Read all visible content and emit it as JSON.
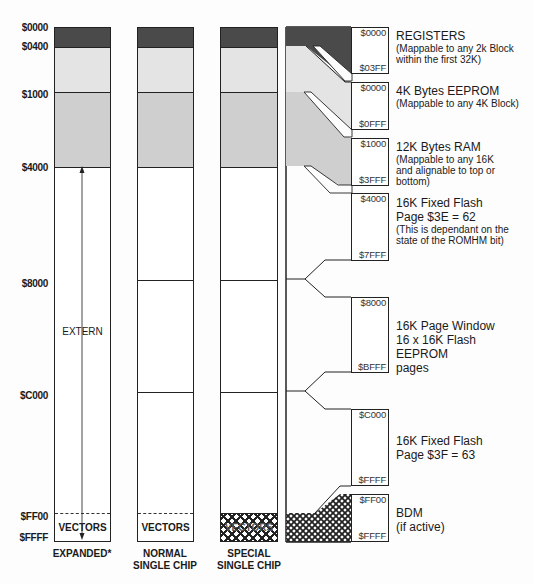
{
  "address_axis": {
    "labels": [
      "$0000",
      "$0400",
      "$1000",
      "$4000",
      "$8000",
      "$C000",
      "$FF00",
      "$FFFF"
    ]
  },
  "columns": [
    {
      "caption_line1": "EXPANDED*",
      "caption_line2": "",
      "bottom_label": "VECTORS",
      "middle_label": "EXTERN"
    },
    {
      "caption_line1": "NORMAL",
      "caption_line2": "SINGLE CHIP",
      "bottom_label": "VECTORS"
    },
    {
      "caption_line1": "SPECIAL",
      "caption_line2": "SINGLE CHIP",
      "bottom_label": "VECTORS"
    }
  ],
  "detail_blocks": [
    {
      "start": "$0000",
      "end": "$03FF",
      "title": "REGISTERS",
      "note": "(Mappable to any 2k Block within the first 32K)"
    },
    {
      "start": "$0000",
      "end": "$0FFF",
      "title": "4K Bytes EEPROM",
      "note": "(Mappable to any 4K Block)"
    },
    {
      "start": "$1000",
      "end": "$3FFF",
      "title": "12K Bytes RAM",
      "note": "(Mappable to any 16K and alignable to top or bottom)"
    },
    {
      "start": "$4000",
      "end": "$7FFF",
      "title": "16K Fixed Flash",
      "title2": "Page $3E = 62",
      "note": "(This is dependant on the state of the ROMHM bit)"
    },
    {
      "start": "$8000",
      "end": "$BFFF",
      "title": "16K Page Window",
      "title2": "16 x 16K Flash EEPROM",
      "title3": "pages"
    },
    {
      "start": "$C000",
      "end": "$FFFF",
      "title": "16K Fixed Flash",
      "title2": "Page $3F = 63"
    },
    {
      "start": "$FF00",
      "end": "$FFFF",
      "title": "BDM",
      "title2": "(if active)"
    }
  ],
  "colors": {
    "registers": "#4a4a4a",
    "eeprom": "#e4e4e4",
    "ram": "#cfcfcf",
    "line": "#222222"
  }
}
